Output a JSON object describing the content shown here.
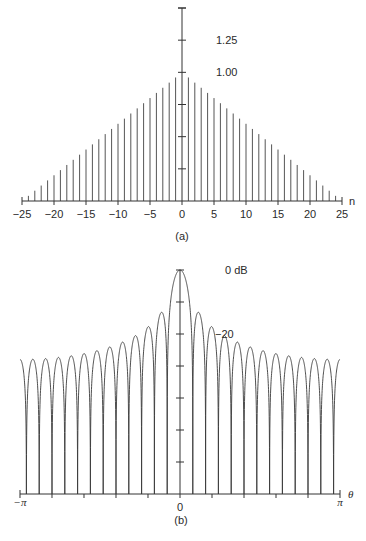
{
  "figure": {
    "panel_a_label": "(a)",
    "panel_b_label": "(b)"
  },
  "chart_data": [
    {
      "type": "bar",
      "subtype": "stem",
      "title": "",
      "panel": "(a)",
      "xlabel": "n",
      "ylabel": "",
      "description": "Triangular (Bartlett) window w[n] = 1 - |n|/25",
      "x_range": [
        -25,
        25
      ],
      "ylim": [
        0,
        1.5
      ],
      "x_ticks": [
        -25,
        -20,
        -15,
        -10,
        -5,
        0,
        5,
        10,
        15,
        20,
        25
      ],
      "x_tick_labels": [
        "−25",
        "−20",
        "−15",
        "−10",
        "−5",
        "0",
        "5",
        "10",
        "15",
        "20",
        "25"
      ],
      "y_ticks": [
        0.25,
        0.5,
        0.75,
        1.0,
        1.25,
        1.5
      ],
      "y_tick_labels_shown": [
        {
          "value": 1.25,
          "label": "1.25"
        },
        {
          "value": 1.0,
          "label": "1.00"
        }
      ],
      "x": [
        -24,
        -23,
        -22,
        -21,
        -20,
        -19,
        -18,
        -17,
        -16,
        -15,
        -14,
        -13,
        -12,
        -11,
        -10,
        -9,
        -8,
        -7,
        -6,
        -5,
        -4,
        -3,
        -2,
        -1,
        0,
        1,
        2,
        3,
        4,
        5,
        6,
        7,
        8,
        9,
        10,
        11,
        12,
        13,
        14,
        15,
        16,
        17,
        18,
        19,
        20,
        21,
        22,
        23,
        24
      ],
      "values": [
        0.04,
        0.08,
        0.12,
        0.16,
        0.2,
        0.24,
        0.28,
        0.32,
        0.36,
        0.4,
        0.44,
        0.48,
        0.52,
        0.56,
        0.6,
        0.64,
        0.68,
        0.72,
        0.76,
        0.8,
        0.84,
        0.88,
        0.92,
        0.96,
        1.0,
        0.96,
        0.92,
        0.88,
        0.84,
        0.8,
        0.76,
        0.72,
        0.68,
        0.64,
        0.6,
        0.56,
        0.52,
        0.48,
        0.44,
        0.4,
        0.36,
        0.32,
        0.28,
        0.24,
        0.2,
        0.16,
        0.12,
        0.08,
        0.04
      ],
      "grid": false
    },
    {
      "type": "line",
      "title": "",
      "panel": "(b)",
      "xlabel": "θ",
      "ylabel": "",
      "description": "Magnitude spectrum (dB) of the triangular window, (1/25)·[sin(25θ/2)/sin(θ/2)]² normalized",
      "x_range": [
        "-π",
        "π"
      ],
      "x_range_numeric": [
        -3.14159,
        3.14159
      ],
      "ylim": [
        -70,
        0
      ],
      "window_N": 25,
      "x_tick_labels": [
        "−π",
        "0",
        "π"
      ],
      "x_ticks_count_per_side": 5,
      "y_ticks_db": [
        0,
        -10,
        -20,
        -30,
        -40,
        -50,
        -60
      ],
      "y_tick_labels_shown": [
        {
          "value": 0,
          "label": "0 dB"
        },
        {
          "value": -20,
          "label": "−20"
        }
      ],
      "first_sidelobe_db": -26.5,
      "edge_sidelobe_db": -56,
      "grid": false
    }
  ]
}
